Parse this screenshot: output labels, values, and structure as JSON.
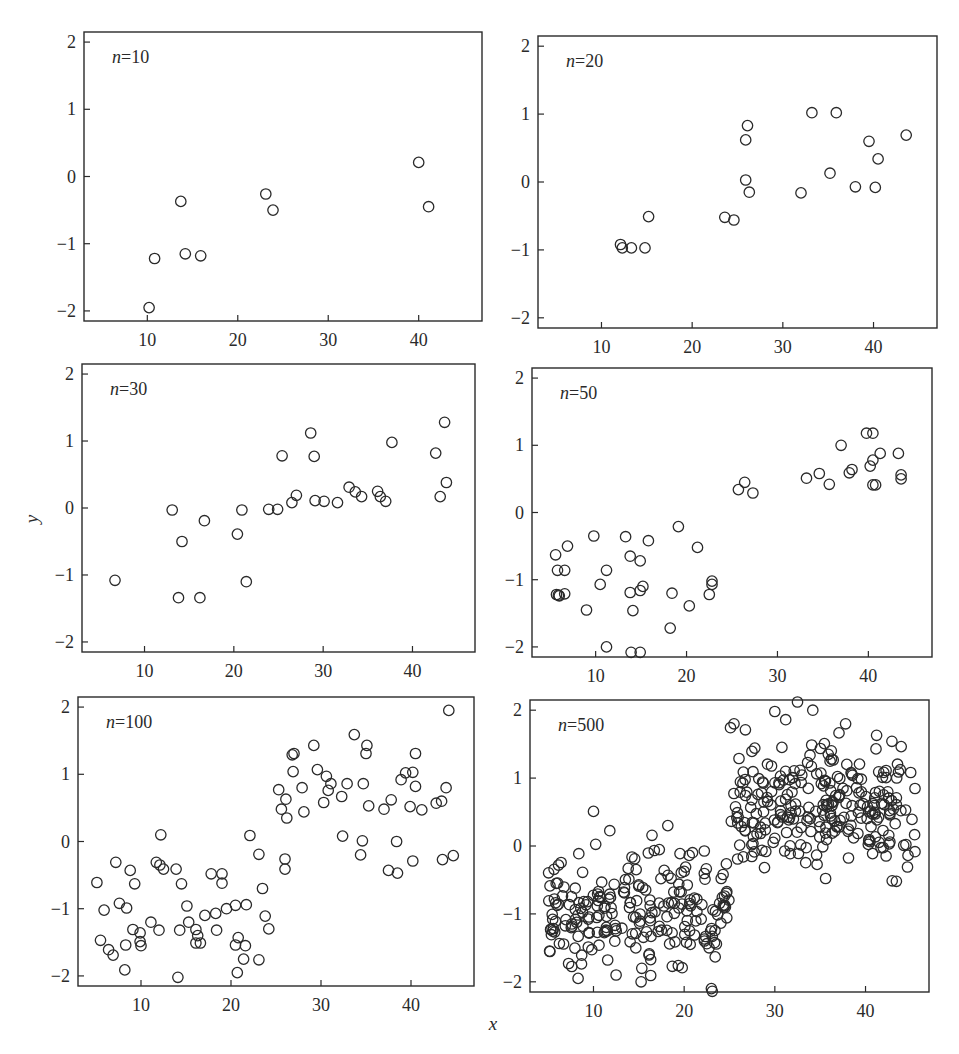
{
  "figure": {
    "xlabel": "x",
    "ylabel": "y",
    "ink_color": "#2a2a2a",
    "background": "#ffffff"
  },
  "chart_data": [
    {
      "type": "scatter",
      "title": "n=10",
      "label_n": "n",
      "label_value": "=10",
      "xlabel": "x",
      "ylabel": "y",
      "xlim": [
        3,
        47
      ],
      "ylim": [
        -2.15,
        2.15
      ],
      "xticks": [
        10,
        20,
        30,
        40
      ],
      "yticks": [
        -2,
        -1,
        0,
        1,
        2
      ],
      "grid": false,
      "marker": "open-circle",
      "points": [
        [
          10.2,
          -1.95
        ],
        [
          10.8,
          -1.22
        ],
        [
          13.7,
          -0.37
        ],
        [
          14.2,
          -1.15
        ],
        [
          15.9,
          -1.18
        ],
        [
          23.1,
          -0.26
        ],
        [
          23.9,
          -0.5
        ],
        [
          40.0,
          0.21
        ],
        [
          41.1,
          -0.45
        ]
      ]
    },
    {
      "type": "scatter",
      "title": "n=20",
      "label_n": "n",
      "label_value": "=20",
      "xlabel": "x",
      "ylabel": "y",
      "xlim": [
        3,
        47
      ],
      "ylim": [
        -2.15,
        2.15
      ],
      "xticks": [
        10,
        20,
        30,
        40
      ],
      "yticks": [
        -2,
        -1,
        0,
        1,
        2
      ],
      "grid": false,
      "marker": "open-circle",
      "points": [
        [
          12.1,
          -0.92
        ],
        [
          12.3,
          -0.97
        ],
        [
          13.3,
          -0.97
        ],
        [
          14.8,
          -0.97
        ],
        [
          15.2,
          -0.51
        ],
        [
          23.6,
          -0.52
        ],
        [
          24.6,
          -0.56
        ],
        [
          25.9,
          0.62
        ],
        [
          26.1,
          0.83
        ],
        [
          25.9,
          0.03
        ],
        [
          26.3,
          -0.15
        ],
        [
          32.0,
          -0.16
        ],
        [
          33.2,
          1.02
        ],
        [
          35.9,
          1.02
        ],
        [
          35.2,
          0.13
        ],
        [
          38.0,
          -0.07
        ],
        [
          39.5,
          0.6
        ],
        [
          40.5,
          0.34
        ],
        [
          40.2,
          -0.08
        ],
        [
          43.6,
          0.69
        ]
      ]
    },
    {
      "type": "scatter",
      "title": "n=30",
      "label_n": "n",
      "label_value": "=30",
      "xlabel": "x",
      "ylabel": "y",
      "xlim": [
        3,
        47
      ],
      "ylim": [
        -2.15,
        2.15
      ],
      "xticks": [
        10,
        20,
        30,
        40
      ],
      "yticks": [
        -2,
        -1,
        0,
        1,
        2
      ],
      "grid": false,
      "marker": "open-circle",
      "points": [
        [
          6.7,
          -1.08
        ],
        [
          13.1,
          -0.03
        ],
        [
          13.8,
          -1.34
        ],
        [
          14.2,
          -0.5
        ],
        [
          16.2,
          -1.34
        ],
        [
          16.7,
          -0.19
        ],
        [
          20.4,
          -0.39
        ],
        [
          20.9,
          -0.03
        ],
        [
          21.4,
          -1.1
        ],
        [
          23.9,
          -0.02
        ],
        [
          24.9,
          -0.02
        ],
        [
          25.4,
          0.78
        ],
        [
          26.5,
          0.08
        ],
        [
          27.0,
          0.19
        ],
        [
          28.6,
          1.12
        ],
        [
          29.0,
          0.77
        ],
        [
          29.1,
          0.11
        ],
        [
          30.1,
          0.1
        ],
        [
          31.6,
          0.08
        ],
        [
          32.9,
          0.31
        ],
        [
          33.6,
          0.24
        ],
        [
          34.3,
          0.17
        ],
        [
          36.1,
          0.25
        ],
        [
          36.4,
          0.17
        ],
        [
          37.0,
          0.1
        ],
        [
          37.7,
          0.98
        ],
        [
          42.6,
          0.82
        ],
        [
          43.1,
          0.17
        ],
        [
          43.6,
          1.28
        ],
        [
          43.8,
          0.38
        ]
      ]
    },
    {
      "type": "scatter",
      "title": "n=50",
      "label_n": "n",
      "label_value": "=50",
      "xlabel": "x",
      "ylabel": "y",
      "xlim": [
        3,
        47
      ],
      "ylim": [
        -2.15,
        2.15
      ],
      "xticks": [
        10,
        20,
        30,
        40
      ],
      "yticks": [
        -2,
        -1,
        0,
        1,
        2
      ],
      "grid": false,
      "marker": "open-circle",
      "points": [
        [
          5.6,
          -0.63
        ],
        [
          5.8,
          -0.86
        ],
        [
          5.7,
          -1.22
        ],
        [
          5.9,
          -1.23
        ],
        [
          6.0,
          -1.24
        ],
        [
          6.6,
          -0.86
        ],
        [
          6.6,
          -1.21
        ],
        [
          6.9,
          -0.5
        ],
        [
          9.0,
          -1.45
        ],
        [
          9.8,
          -0.35
        ],
        [
          10.5,
          -1.07
        ],
        [
          11.2,
          -0.86
        ],
        [
          11.2,
          -2.0
        ],
        [
          13.3,
          -0.36
        ],
        [
          13.8,
          -0.65
        ],
        [
          13.8,
          -1.19
        ],
        [
          14.1,
          -1.46
        ],
        [
          13.9,
          -2.08
        ],
        [
          14.9,
          -0.72
        ],
        [
          14.9,
          -1.16
        ],
        [
          15.2,
          -1.1
        ],
        [
          14.9,
          -2.08
        ],
        [
          15.8,
          -0.42
        ],
        [
          18.2,
          -1.72
        ],
        [
          18.4,
          -1.2
        ],
        [
          19.1,
          -0.21
        ],
        [
          20.3,
          -1.39
        ],
        [
          21.2,
          -0.52
        ],
        [
          22.5,
          -1.22
        ],
        [
          22.8,
          -1.02
        ],
        [
          22.8,
          -1.07
        ],
        [
          25.7,
          0.34
        ],
        [
          26.4,
          0.45
        ],
        [
          27.3,
          0.29
        ],
        [
          33.2,
          0.51
        ],
        [
          34.6,
          0.58
        ],
        [
          35.7,
          0.42
        ],
        [
          37.0,
          1.0
        ],
        [
          37.9,
          0.59
        ],
        [
          38.2,
          0.64
        ],
        [
          39.8,
          1.18
        ],
        [
          40.5,
          1.18
        ],
        [
          40.2,
          0.69
        ],
        [
          40.5,
          0.78
        ],
        [
          40.5,
          0.41
        ],
        [
          40.8,
          0.41
        ],
        [
          41.3,
          0.88
        ],
        [
          43.3,
          0.88
        ],
        [
          43.6,
          0.56
        ],
        [
          43.6,
          0.5
        ]
      ]
    },
    {
      "type": "scatter",
      "title": "n=100",
      "label_n": "n",
      "label_value": "=100",
      "xlabel": "x",
      "ylabel": "y",
      "xlim": [
        3,
        47
      ],
      "ylim": [
        -2.15,
        2.15
      ],
      "xticks": [
        10,
        20,
        30,
        40
      ],
      "yticks": [
        -2,
        -1,
        0,
        1,
        2
      ],
      "grid": false,
      "marker": "open-circle",
      "points": [
        [
          5.1,
          -0.61
        ],
        [
          5.5,
          -1.47
        ],
        [
          5.9,
          -1.02
        ],
        [
          6.4,
          -1.61
        ],
        [
          6.9,
          -1.69
        ],
        [
          7.2,
          -0.31
        ],
        [
          7.6,
          -0.92
        ],
        [
          8.2,
          -1.91
        ],
        [
          8.3,
          -1.54
        ],
        [
          8.4,
          -0.99
        ],
        [
          8.8,
          -0.43
        ],
        [
          9.1,
          -1.31
        ],
        [
          9.3,
          -0.63
        ],
        [
          9.9,
          -1.36
        ],
        [
          9.9,
          -1.49
        ],
        [
          10.0,
          -1.55
        ],
        [
          11.1,
          -1.2
        ],
        [
          11.7,
          -0.31
        ],
        [
          12.0,
          -1.32
        ],
        [
          12.1,
          -0.35
        ],
        [
          12.2,
          0.1
        ],
        [
          12.5,
          -0.41
        ],
        [
          13.9,
          -0.41
        ],
        [
          14.1,
          -2.02
        ],
        [
          14.3,
          -1.32
        ],
        [
          14.5,
          -0.63
        ],
        [
          15.1,
          -0.96
        ],
        [
          15.3,
          -1.2
        ],
        [
          16.1,
          -1.31
        ],
        [
          16.1,
          -1.51
        ],
        [
          16.3,
          -1.4
        ],
        [
          16.6,
          -1.51
        ],
        [
          17.1,
          -1.1
        ],
        [
          17.8,
          -0.48
        ],
        [
          18.3,
          -1.07
        ],
        [
          18.4,
          -1.32
        ],
        [
          19.0,
          -0.48
        ],
        [
          19.0,
          -0.62
        ],
        [
          19.5,
          -1.0
        ],
        [
          20.5,
          -0.95
        ],
        [
          20.5,
          -1.54
        ],
        [
          20.8,
          -1.43
        ],
        [
          20.7,
          -1.95
        ],
        [
          21.4,
          -1.75
        ],
        [
          21.6,
          -1.55
        ],
        [
          21.7,
          -0.94
        ],
        [
          22.1,
          0.09
        ],
        [
          23.1,
          -0.19
        ],
        [
          23.1,
          -1.76
        ],
        [
          23.5,
          -0.7
        ],
        [
          23.8,
          -1.11
        ],
        [
          24.2,
          -1.3
        ],
        [
          25.3,
          0.77
        ],
        [
          25.6,
          0.48
        ],
        [
          26.0,
          -0.26
        ],
        [
          26.0,
          -0.41
        ],
        [
          26.1,
          0.63
        ],
        [
          26.2,
          0.35
        ],
        [
          26.8,
          1.29
        ],
        [
          27.0,
          1.31
        ],
        [
          26.9,
          1.04
        ],
        [
          27.9,
          0.8
        ],
        [
          28.1,
          0.44
        ],
        [
          29.2,
          1.43
        ],
        [
          29.6,
          1.07
        ],
        [
          30.3,
          0.58
        ],
        [
          30.6,
          0.97
        ],
        [
          30.8,
          0.76
        ],
        [
          31.1,
          0.86
        ],
        [
          32.3,
          0.67
        ],
        [
          32.4,
          0.08
        ],
        [
          32.9,
          0.86
        ],
        [
          33.7,
          1.59
        ],
        [
          34.4,
          -0.2
        ],
        [
          34.6,
          0.01
        ],
        [
          34.7,
          0.86
        ],
        [
          35.0,
          1.31
        ],
        [
          35.1,
          1.43
        ],
        [
          35.3,
          0.53
        ],
        [
          37.0,
          0.48
        ],
        [
          37.5,
          -0.43
        ],
        [
          37.8,
          0.62
        ],
        [
          38.4,
          0.0
        ],
        [
          38.5,
          -0.47
        ],
        [
          38.9,
          0.92
        ],
        [
          39.4,
          1.02
        ],
        [
          39.9,
          0.52
        ],
        [
          40.2,
          -0.29
        ],
        [
          40.2,
          1.03
        ],
        [
          40.5,
          1.31
        ],
        [
          40.5,
          0.82
        ],
        [
          41.2,
          0.47
        ],
        [
          42.8,
          0.57
        ],
        [
          43.4,
          0.6
        ],
        [
          43.5,
          -0.27
        ],
        [
          43.9,
          0.8
        ],
        [
          44.2,
          1.95
        ],
        [
          44.7,
          -0.21
        ]
      ]
    },
    {
      "type": "scatter",
      "title": "n=500",
      "label_n": "n",
      "label_value": "=500",
      "xlabel": "x",
      "ylabel": "y",
      "xlim": [
        3,
        47
      ],
      "ylim": [
        -2.15,
        2.15
      ],
      "xticks": [
        10,
        20,
        30,
        40
      ],
      "yticks": [
        -2,
        -1,
        0,
        1,
        2
      ],
      "grid": false,
      "marker": "open-circle",
      "n_points": 500,
      "description": "Step function with noise: for x in [5,25] y clusters around -1 (range about -2.1 to 0.5); for x in [25,45] y clusters around 0.6 (range about -0.6 to 2.1).",
      "generator": {
        "seed": 12345,
        "x_range": [
          5,
          45.5
        ],
        "step_at": 25,
        "mean_left": -0.95,
        "mean_right": 0.55,
        "sd": 0.45
      },
      "notable_points": [
        [
          10.0,
          0.51
        ],
        [
          18.2,
          0.3
        ],
        [
          23.0,
          -2.1
        ],
        [
          23.1,
          -2.14
        ],
        [
          31.2,
          1.86
        ],
        [
          32.5,
          2.12
        ],
        [
          25.5,
          1.8
        ],
        [
          37.8,
          1.8
        ],
        [
          8.3,
          -1.95
        ],
        [
          12.5,
          -1.9
        ],
        [
          43.4,
          -0.52
        ]
      ]
    }
  ]
}
